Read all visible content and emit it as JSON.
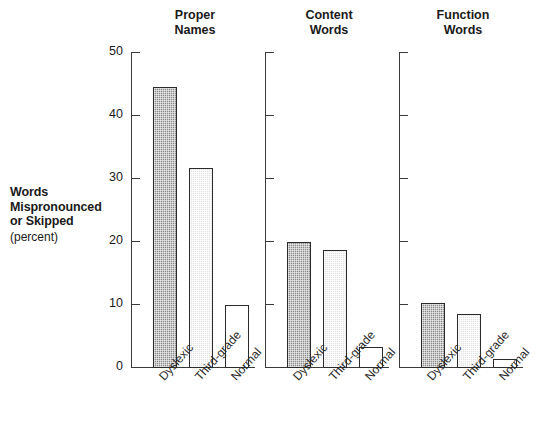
{
  "axis": {
    "y_title_lines": [
      "Words",
      "Mispronounced",
      "or Skipped"
    ],
    "y_unit": "(percent)",
    "y_ticks": [
      "0",
      "10",
      "20",
      "30",
      "40",
      "50"
    ],
    "y_min": 0,
    "y_max": 50
  },
  "categories": [
    "Dyslexic",
    "Third-grade",
    "Normal"
  ],
  "panels": [
    {
      "title_lines": [
        "Proper",
        "Names"
      ],
      "values": [
        44.6,
        31.8,
        10.0
      ]
    },
    {
      "title_lines": [
        "Content",
        "Words"
      ],
      "values": [
        20.0,
        18.8,
        3.4
      ]
    },
    {
      "title_lines": [
        "Function",
        "Words"
      ],
      "values": [
        10.3,
        8.5,
        1.4
      ]
    }
  ],
  "colors": {
    "axis": "#3a3a3a",
    "bar_outline": "#2b2b2b",
    "bar_dyslexic": "#8a8a8a",
    "bar_thirdgrade": "#e4e4e4",
    "bar_normal": "#ffffff",
    "text": "#1a1a1a",
    "background": "#ffffff"
  },
  "chart_data": {
    "type": "bar",
    "title": "",
    "subtitle": "",
    "xlabel": "",
    "ylabel": "Words Mispronounced or Skipped (percent)",
    "ylim": [
      0,
      50
    ],
    "yticks": [
      0,
      10,
      20,
      30,
      40,
      50
    ],
    "grid": false,
    "legend": "none",
    "panel_layout": "three side-by-side panels sharing one y-axis scale",
    "categories": [
      "Dyslexic",
      "Third-grade",
      "Normal"
    ],
    "panels": [
      {
        "name": "Proper Names",
        "series": [
          {
            "name": "Proper Names",
            "values": [
              44.6,
              31.8,
              10.0
            ]
          }
        ]
      },
      {
        "name": "Content Words",
        "series": [
          {
            "name": "Content Words",
            "values": [
              20.0,
              18.8,
              3.4
            ]
          }
        ]
      },
      {
        "name": "Function Words",
        "series": [
          {
            "name": "Function Words",
            "values": [
              10.3,
              8.5,
              1.4
            ]
          }
        ]
      }
    ],
    "bar_styles": {
      "Dyslexic": "dark dithered / checkered gray fill, black outline",
      "Third-grade": "light dithered gray fill, black outline",
      "Normal": "white fill, black outline"
    },
    "annotations": []
  }
}
